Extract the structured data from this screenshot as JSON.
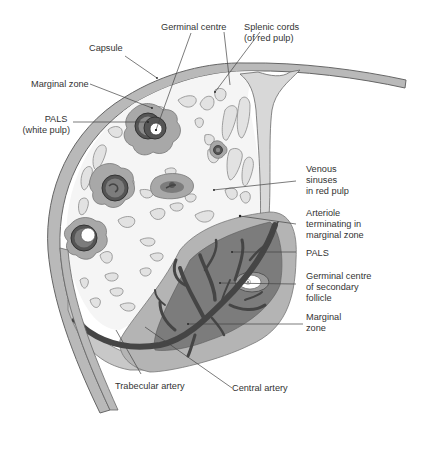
{
  "diagram": {
    "colors": {
      "capsule_fill": "#b9b9b9",
      "capsule_stroke": "#666666",
      "pulp_background": "#f4f4f4",
      "cords_fill": "#e2e2e2",
      "cords_stroke": "#8a8a8a",
      "marginal_zone": "#a8a8a8",
      "pals": "#7a7a7a",
      "artery": "#4a4a4a",
      "germinal_centre": "#ffffff",
      "leader_line": "#444444",
      "label_text": "#333333"
    },
    "labels": {
      "germinal_centre_top": [
        "Germinal centre"
      ],
      "splenic_cords": [
        "Splenic cords",
        "(of red pulp)"
      ],
      "capsule": [
        "Capsule"
      ],
      "marginal_zone_top": [
        "Marginal zone"
      ],
      "pals_white_pulp": [
        "PALS",
        "(white pulp)"
      ],
      "venous_sinuses": [
        "Venous",
        "sinuses",
        "in red pulp"
      ],
      "arteriole": [
        "Arteriole",
        "terminating in",
        "marginal zone"
      ],
      "pals_right": [
        "PALS"
      ],
      "germinal_secondary": [
        "Germinal centre",
        "of secondary",
        "follicle"
      ],
      "marginal_zone_right": [
        "Marginal",
        "zone"
      ],
      "trabecular_artery": [
        "Trabecular artery"
      ],
      "central_artery": [
        "Central artery"
      ]
    }
  }
}
